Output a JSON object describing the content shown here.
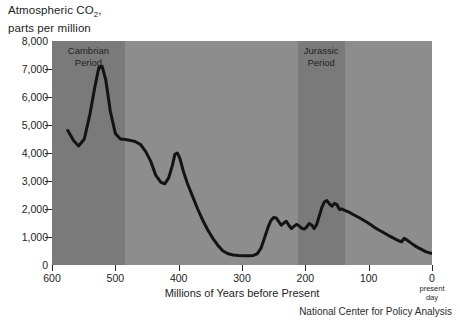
{
  "title": {
    "line1": "Atmospheric CO",
    "line1_sub": "2",
    "line1_tail": ",",
    "line2": "parts per million"
  },
  "attribution": "National Center for Policy Analysis",
  "present_day_note": {
    "line1": "present",
    "line2": "day"
  },
  "colors": {
    "plot_background": "#8d8d8d",
    "period_band": "#7a7a7a",
    "series_line": "#131313",
    "axis": "#2a2a2a",
    "text": "#1d1d1d",
    "page_background": "#ffffff"
  },
  "chart_data": {
    "type": "line",
    "title": "Atmospheric CO2, parts per million",
    "xlabel": "Millions of Years before Present",
    "ylabel": "Atmospheric CO2, parts per million",
    "xlim": [
      600,
      0
    ],
    "ylim": [
      0,
      8000
    ],
    "x_reversed": true,
    "grid": false,
    "legend": null,
    "xticks": [
      600,
      500,
      400,
      300,
      200,
      100,
      0
    ],
    "xticklabels": [
      "600",
      "500",
      "400",
      "300",
      "200",
      "100",
      "0"
    ],
    "yticks": [
      0,
      1000,
      2000,
      3000,
      4000,
      5000,
      6000,
      7000,
      8000
    ],
    "yticklabels": [
      "0",
      "1,000",
      "2,000",
      "3,000",
      "4,000",
      "5,000",
      "6,000",
      "7,000",
      "8,000"
    ],
    "annotations": [
      {
        "text": "Cambrian Period",
        "x_start": 600,
        "x_end": 485,
        "type": "vspan"
      },
      {
        "text": "Jurassic Period",
        "x_start": 212,
        "x_end": 138,
        "type": "vspan"
      }
    ],
    "series": [
      {
        "name": "Atmospheric CO2",
        "x": [
          575,
          566,
          558,
          549,
          540,
          532,
          526,
          521,
          515,
          508,
          500,
          492,
          484,
          476,
          468,
          460,
          452,
          444,
          436,
          428,
          422,
          416,
          410,
          406,
          402,
          398,
          392,
          386,
          378,
          370,
          362,
          354,
          346,
          338,
          330,
          322,
          314,
          306,
          298,
          290,
          282,
          276,
          270,
          264,
          258,
          254,
          250,
          246,
          242,
          238,
          234,
          230,
          226,
          222,
          218,
          214,
          210,
          206,
          202,
          198,
          194,
          190,
          186,
          182,
          178,
          174,
          170,
          166,
          162,
          158,
          154,
          150,
          146,
          142,
          138,
          132,
          126,
          120,
          114,
          108,
          102,
          96,
          90,
          84,
          78,
          72,
          66,
          60,
          54,
          48,
          44,
          40,
          34,
          28,
          22,
          16,
          10,
          5,
          0
        ],
        "y": [
          4800,
          4450,
          4250,
          4500,
          5400,
          6400,
          7050,
          7100,
          6600,
          5500,
          4700,
          4500,
          4480,
          4450,
          4400,
          4300,
          4050,
          3700,
          3200,
          2950,
          2900,
          3100,
          3550,
          3950,
          4000,
          3800,
          3300,
          2900,
          2450,
          2000,
          1600,
          1250,
          950,
          700,
          500,
          400,
          360,
          340,
          330,
          330,
          340,
          400,
          600,
          1000,
          1400,
          1600,
          1700,
          1680,
          1550,
          1420,
          1500,
          1560,
          1420,
          1300,
          1380,
          1450,
          1400,
          1320,
          1280,
          1350,
          1480,
          1430,
          1300,
          1450,
          1750,
          2050,
          2250,
          2300,
          2180,
          2100,
          2200,
          2150,
          1980,
          2000,
          1950,
          1900,
          1820,
          1750,
          1680,
          1600,
          1520,
          1430,
          1330,
          1250,
          1180,
          1100,
          1020,
          950,
          880,
          830,
          950,
          900,
          800,
          700,
          620,
          550,
          480,
          440,
          420
        ],
        "color": "#131313",
        "linewidth": 3
      }
    ]
  }
}
